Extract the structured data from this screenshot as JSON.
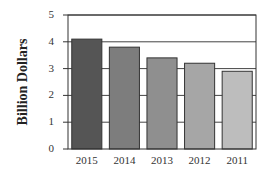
{
  "chart_data": {
    "type": "bar",
    "title": "",
    "xlabel": "",
    "ylabel": "Billion Dollars",
    "categories": [
      "2015",
      "2014",
      "2013",
      "2012",
      "2011"
    ],
    "values": [
      4.1,
      3.8,
      3.4,
      3.2,
      2.9
    ],
    "ylim": [
      0,
      5
    ],
    "yticks": [
      0,
      1,
      2,
      3,
      4,
      5
    ],
    "grid": "horizontal",
    "legend": null,
    "bar_colors": [
      "#555555",
      "#7d7d7d",
      "#8f8f8f",
      "#a6a6a6",
      "#bdbdbd"
    ]
  },
  "colors": {
    "axis": "#333333",
    "grid": "#444444",
    "bar_edge": "#333333"
  }
}
